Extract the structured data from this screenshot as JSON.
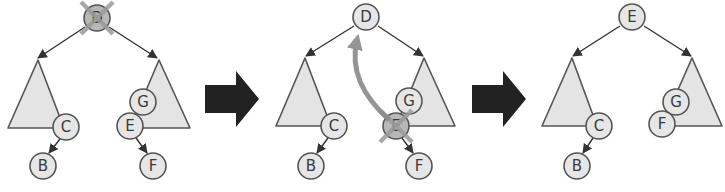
{
  "colors": {
    "node_fill": "#e6e6e6",
    "node_stroke": "#555555",
    "subtree_fill": "#e4e4e4",
    "edge": "#333333",
    "deletion_mark": "#9a9a9a",
    "move_arrow": "#8a8a8a",
    "step_arrow": "#222222"
  },
  "panels": [
    {
      "step": 1,
      "description": "Node D to be deleted",
      "root": {
        "label": "D",
        "marked_deleted": true
      },
      "left_subtree": {
        "nodes": [
          {
            "label": "C"
          },
          {
            "label": "B"
          }
        ]
      },
      "right_subtree": {
        "nodes": [
          {
            "label": "G"
          },
          {
            "label": "E"
          },
          {
            "label": "F"
          }
        ]
      }
    },
    {
      "step": 2,
      "description": "In-order successor E moves up to replace D",
      "root": {
        "label": "D",
        "marked_deleted": false
      },
      "left_subtree": {
        "nodes": [
          {
            "label": "C"
          },
          {
            "label": "B"
          }
        ]
      },
      "right_subtree": {
        "nodes": [
          {
            "label": "G"
          },
          {
            "label": "E",
            "marked_deleted": true
          },
          {
            "label": "F"
          }
        ]
      },
      "move_arrow": {
        "from": "E",
        "to": "D"
      }
    },
    {
      "step": 3,
      "description": "E is new root; F takes E's place",
      "root": {
        "label": "E",
        "marked_deleted": false
      },
      "left_subtree": {
        "nodes": [
          {
            "label": "C"
          },
          {
            "label": "B"
          }
        ]
      },
      "right_subtree": {
        "nodes": [
          {
            "label": "G"
          },
          {
            "label": "F"
          }
        ]
      }
    }
  ],
  "step_arrows": [
    {
      "from_step": 1,
      "to_step": 2,
      "icon": "right-arrow-icon"
    },
    {
      "from_step": 2,
      "to_step": 3,
      "icon": "right-arrow-icon"
    }
  ]
}
